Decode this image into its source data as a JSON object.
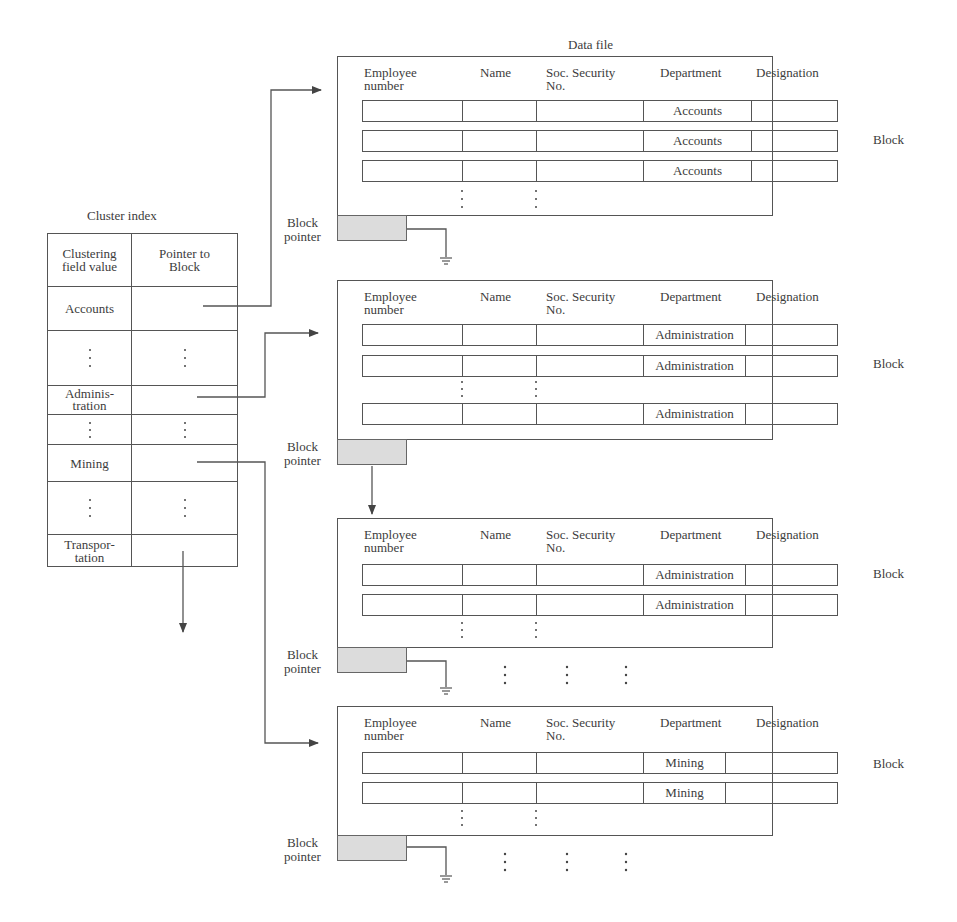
{
  "diagram": {
    "data_file_title": "Data file",
    "cluster_index": {
      "title": "Cluster index",
      "headers": [
        "Clustering field value",
        "Pointer to Block"
      ],
      "header_lines": [
        [
          "Clustering",
          "field value"
        ],
        [
          "Pointer to",
          "Block"
        ]
      ],
      "rows": [
        {
          "value": "Accounts",
          "value_lines": [
            "Accounts"
          ],
          "ellipsis": false,
          "points_to": "block-1"
        },
        {
          "value": "",
          "ellipsis": true
        },
        {
          "value": "Administration",
          "value_lines": [
            "Adminis-",
            "tration"
          ],
          "ellipsis": false,
          "points_to": "block-2"
        },
        {
          "value": "",
          "ellipsis": true
        },
        {
          "value": "Mining",
          "value_lines": [
            "Mining"
          ],
          "ellipsis": false,
          "points_to": "block-4"
        },
        {
          "value": "",
          "ellipsis": true
        },
        {
          "value": "Transportation",
          "value_lines": [
            "Transpor-",
            "tation"
          ],
          "ellipsis": false,
          "points_to": "continues-below"
        }
      ]
    },
    "record_columns": [
      "Employee number",
      "Name",
      "Soc. Security No.",
      "Department",
      "Designation"
    ],
    "record_column_lines": [
      [
        "Employee",
        "number"
      ],
      [
        "Name"
      ],
      [
        "Soc. Security",
        "No."
      ],
      [
        "Department"
      ],
      [
        "Designation"
      ]
    ],
    "block_label": "Block",
    "block_pointer_label": "Block pointer",
    "block_pointer_lines": [
      "Block",
      "pointer"
    ],
    "blocks": [
      {
        "id": "block-1",
        "department_values": [
          "Accounts",
          "Accounts",
          "Accounts"
        ],
        "has_more_rows": true,
        "next_pointer": "null"
      },
      {
        "id": "block-2",
        "department_values": [
          "Administration",
          "Administration",
          "Administration"
        ],
        "has_more_rows": true,
        "next_pointer": "block-3"
      },
      {
        "id": "block-3",
        "department_values": [
          "Administration",
          "Administration"
        ],
        "has_more_rows": true,
        "next_pointer": "null"
      },
      {
        "id": "block-4",
        "department_values": [
          "Mining",
          "Mining"
        ],
        "has_more_rows": true,
        "next_pointer": "null"
      }
    ],
    "colors": {
      "line": "#555555",
      "pointer_fill": "#dcdcdc",
      "text": "#3c3c3c",
      "background": "#ffffff"
    }
  }
}
